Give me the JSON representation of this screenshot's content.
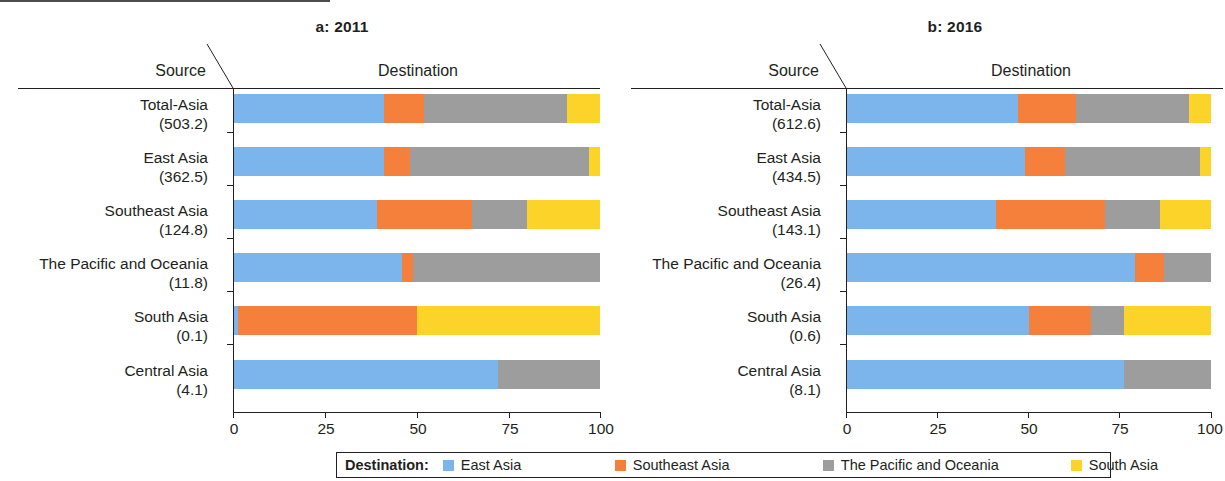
{
  "panels": [
    {
      "id": "a",
      "title": "a: 2011",
      "source_header": "Source",
      "destination_header": "Destination",
      "rows": [
        {
          "name": "Total-Asia",
          "value": "(503.2)"
        },
        {
          "name": "East Asia",
          "value": "(362.5)"
        },
        {
          "name": "Southeast Asia",
          "value": "(124.8)"
        },
        {
          "name": "The Pacific and Oceania",
          "value": "(11.8)"
        },
        {
          "name": "South Asia",
          "value": "(0.1)"
        },
        {
          "name": "Central Asia",
          "value": "(4.1)"
        }
      ],
      "xticks": [
        "0",
        "25",
        "50",
        "75",
        "100"
      ]
    },
    {
      "id": "b",
      "title": "b: 2016",
      "source_header": "Source",
      "destination_header": "Destination",
      "rows": [
        {
          "name": "Total-Asia",
          "value": "(612.6)"
        },
        {
          "name": "East Asia",
          "value": "(434.5)"
        },
        {
          "name": "Southeast Asia",
          "value": "(143.1)"
        },
        {
          "name": "The Pacific and Oceania",
          "value": "(26.4)"
        },
        {
          "name": "South Asia",
          "value": "(0.6)"
        },
        {
          "name": "Central Asia",
          "value": "(8.1)"
        }
      ],
      "xticks": [
        "0",
        "25",
        "50",
        "75",
        "100"
      ]
    }
  ],
  "legend": {
    "title": "Destination:",
    "items": [
      {
        "label": "East Asia",
        "color": "#7cb5ec"
      },
      {
        "label": "Southeast Asia",
        "color": "#f4803c"
      },
      {
        "label": "The Pacific and Oceania",
        "color": "#9d9d9d"
      },
      {
        "label": "South Asia",
        "color": "#fcd328"
      }
    ]
  },
  "colors": {
    "east_asia": "#7cb5ec",
    "southeast_asia": "#f4803c",
    "pacific_oceania": "#9d9d9d",
    "south_asia": "#fcd328",
    "axis": "#231f20",
    "background": "#ffffff"
  },
  "chart_data": {
    "type": "bar",
    "subtype": "stacked-horizontal-100-percent",
    "xlabel": "",
    "ylabel": "",
    "xlim": [
      0,
      100
    ],
    "xticks": [
      0,
      25,
      50,
      75,
      100
    ],
    "grid": false,
    "legend_position": "bottom",
    "legend_title": "Destination:",
    "series_names": [
      "East Asia",
      "Southeast Asia",
      "The Pacific and Oceania",
      "South Asia"
    ],
    "series_colors": [
      "#7cb5ec",
      "#f4803c",
      "#9d9d9d",
      "#fcd328"
    ],
    "panels": [
      {
        "panel": "a",
        "title": "a: 2011",
        "categories": [
          "Total-Asia",
          "East Asia",
          "Southeast Asia",
          "The Pacific and Oceania",
          "South Asia",
          "Central Asia"
        ],
        "category_totals": [
          503.2,
          362.5,
          124.8,
          11.8,
          0.1,
          4.1
        ],
        "series": [
          {
            "name": "East Asia",
            "values": [
              41,
              41,
              39,
              46,
              1,
              72
            ]
          },
          {
            "name": "Southeast Asia",
            "values": [
              11,
              7,
              26,
              3,
              49,
              0
            ]
          },
          {
            "name": "The Pacific and Oceania",
            "values": [
              39,
              49,
              15,
              51,
              0,
              28
            ]
          },
          {
            "name": "South Asia",
            "values": [
              9,
              3,
              20,
              0,
              50,
              0
            ]
          }
        ]
      },
      {
        "panel": "b",
        "title": "b: 2016",
        "categories": [
          "Total-Asia",
          "East Asia",
          "Southeast Asia",
          "The Pacific and Oceania",
          "South Asia",
          "Central Asia"
        ],
        "category_totals": [
          612.6,
          434.5,
          143.1,
          26.4,
          0.6,
          8.1
        ],
        "series": [
          {
            "name": "East Asia",
            "values": [
              47,
              49,
              41,
              79,
              50,
              76
            ]
          },
          {
            "name": "Southeast Asia",
            "values": [
              16,
              11,
              30,
              8,
              17,
              0
            ]
          },
          {
            "name": "The Pacific and Oceania",
            "values": [
              31,
              37,
              15,
              13,
              9,
              24
            ]
          },
          {
            "name": "South Asia",
            "values": [
              6,
              3,
              14,
              0,
              24,
              0
            ]
          }
        ]
      }
    ]
  }
}
